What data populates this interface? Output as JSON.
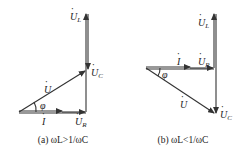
{
  "diagrams": [
    {
      "id": "a",
      "caption": "(a) ωL>1/ωC",
      "labels": {
        "U_L": "U",
        "U_L_sub": "L",
        "U_C": "U",
        "U_C_sub": "C",
        "U": "U",
        "U_R": "U",
        "U_R_sub": "R",
        "I": "I",
        "phi": "φ"
      }
    },
    {
      "id": "b",
      "caption": "(b) ωL<1/ωC",
      "labels": {
        "U_L": "U",
        "U_L_sub": "L",
        "U_C": "U",
        "U_C_sub": "C",
        "U": "U",
        "U_R": "U",
        "U_R_sub": "R",
        "I": "I",
        "phi": "φ"
      }
    }
  ],
  "colors": {
    "line": "#333333",
    "text": "#222222",
    "background": "#ffffff"
  }
}
